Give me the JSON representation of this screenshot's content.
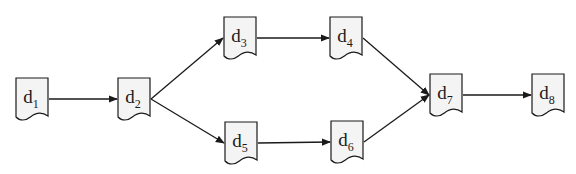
{
  "diagram": {
    "type": "flow-diagram",
    "node_shape": "document",
    "colors": {
      "stroke": "#1a1a1a",
      "fill": "#f4f4f4",
      "background": "#ffffff"
    },
    "nodes": [
      {
        "id": "d1",
        "label": "d",
        "subscript": "1",
        "x": 16,
        "y": 78,
        "w": 32,
        "h": 42
      },
      {
        "id": "d2",
        "label": "d",
        "subscript": "2",
        "x": 118,
        "y": 78,
        "w": 32,
        "h": 42
      },
      {
        "id": "d3",
        "label": "d",
        "subscript": "3",
        "x": 224,
        "y": 17,
        "w": 32,
        "h": 42
      },
      {
        "id": "d4",
        "label": "d",
        "subscript": "4",
        "x": 330,
        "y": 17,
        "w": 32,
        "h": 42
      },
      {
        "id": "d5",
        "label": "d",
        "subscript": "5",
        "x": 225,
        "y": 122,
        "w": 32,
        "h": 42
      },
      {
        "id": "d6",
        "label": "d",
        "subscript": "6",
        "x": 331,
        "y": 121,
        "w": 32,
        "h": 42
      },
      {
        "id": "d7",
        "label": "d",
        "subscript": "7",
        "x": 430,
        "y": 74,
        "w": 32,
        "h": 42
      },
      {
        "id": "d8",
        "label": "d",
        "subscript": "8",
        "x": 532,
        "y": 74,
        "w": 32,
        "h": 42
      }
    ],
    "edges": [
      {
        "from": "d1",
        "to": "d2"
      },
      {
        "from": "d2",
        "to": "d3"
      },
      {
        "from": "d2",
        "to": "d5"
      },
      {
        "from": "d3",
        "to": "d4"
      },
      {
        "from": "d5",
        "to": "d6"
      },
      {
        "from": "d4",
        "to": "d7"
      },
      {
        "from": "d6",
        "to": "d7"
      },
      {
        "from": "d7",
        "to": "d8"
      }
    ]
  }
}
